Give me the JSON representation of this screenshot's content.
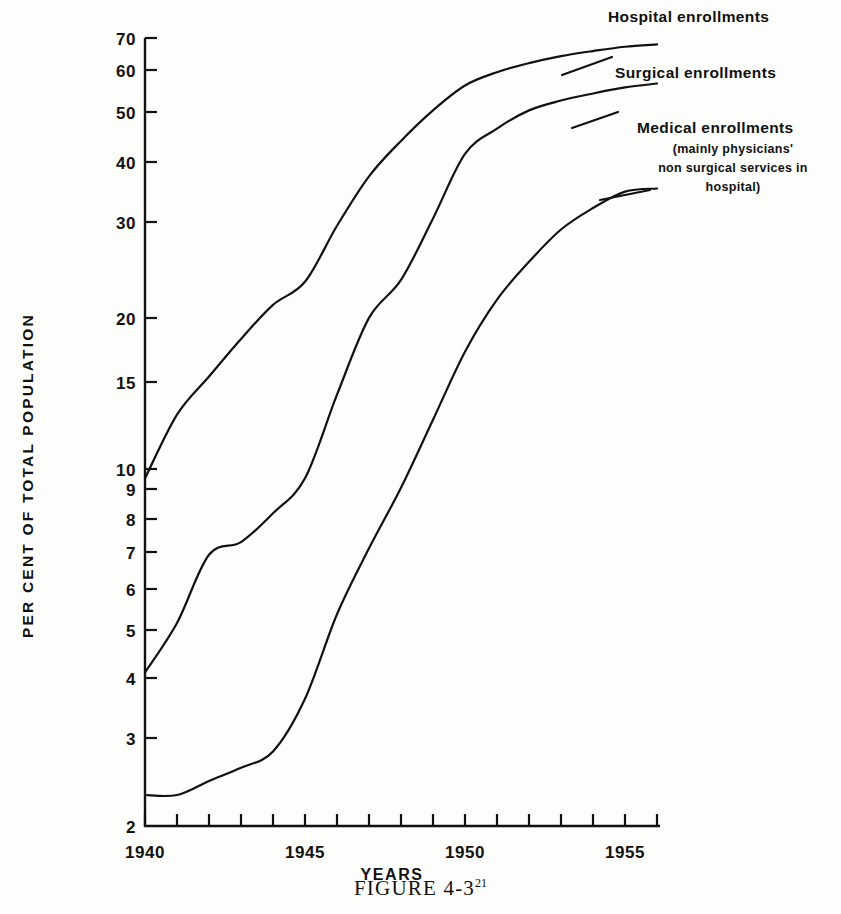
{
  "figure": {
    "caption": "FIGURE 4-3",
    "caption_superscript": "21"
  },
  "axes": {
    "ylabel": "PER CENT OF TOTAL POPULATION",
    "xlabel": "YEARS",
    "y_ticks": [
      "70",
      "60",
      "50",
      "40",
      "30",
      "20",
      "15",
      "10",
      "9",
      "8",
      "7",
      "6",
      "5",
      "4",
      "3",
      "2"
    ],
    "x_ticks": [
      "1940",
      "1945",
      "1950",
      "1955"
    ]
  },
  "annotations": {
    "hospital": "Hospital enrollments",
    "surgical": "Surgical enrollments",
    "medical": "Medical enrollments",
    "medical_sub_1": "(mainly physicians'",
    "medical_sub_2": "non surgical services in",
    "medical_sub_3": "hospital)"
  },
  "colors": {
    "ink": "#111111",
    "paper": "#fdfdfb"
  },
  "chart_data": {
    "type": "line",
    "title": "FIGURE 4-3",
    "xlabel": "YEARS",
    "ylabel": "PER CENT OF TOTAL POPULATION",
    "yscale": "log",
    "ylim": [
      2,
      70
    ],
    "xlim": [
      1939,
      1956.5
    ],
    "grid": false,
    "legend": "inline-annotations",
    "y_tick_values": [
      70,
      60,
      50,
      40,
      30,
      20,
      15,
      10,
      9,
      8,
      7,
      6,
      5,
      4,
      3,
      2
    ],
    "x_tick_values": [
      1940,
      1945,
      1950,
      1955
    ],
    "x_minor_tick_step": 1,
    "x": [
      1940,
      1941,
      1942,
      1943,
      1944,
      1945,
      1946,
      1947,
      1948,
      1949,
      1950,
      1951,
      1952,
      1953,
      1954,
      1955,
      1956
    ],
    "series": [
      {
        "name": "Hospital enrollments",
        "values": [
          9.6,
          12.8,
          15.2,
          18.0,
          21.0,
          23.3,
          30.0,
          37.5,
          44.0,
          50.5,
          56.5,
          60.0,
          62.5,
          64.5,
          66.0,
          67.3,
          68.0
        ]
      },
      {
        "name": "Surgical enrollments",
        "values": [
          4.0,
          5.0,
          6.8,
          7.2,
          8.2,
          9.6,
          14.0,
          19.8,
          23.5,
          31.0,
          41.5,
          46.5,
          50.5,
          52.8,
          54.5,
          56.0,
          57.0
        ]
      },
      {
        "name": "Medical enrollments (mainly physicians' non surgical services in hospital)",
        "values": [
          2.3,
          2.3,
          2.45,
          2.6,
          2.8,
          3.55,
          5.2,
          7.0,
          9.2,
          12.5,
          17.0,
          21.5,
          25.5,
          29.5,
          32.5,
          35.0,
          35.5
        ]
      }
    ]
  }
}
